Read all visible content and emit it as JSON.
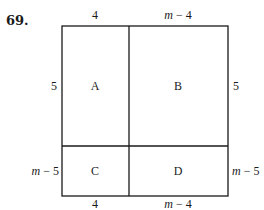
{
  "problem_number": "69.",
  "diagram": {
    "type": "area-model-square",
    "outer_box": {
      "x1": 62,
      "y1": 26,
      "x2": 228,
      "y2": 196
    },
    "dividers": {
      "vertical_x": 129,
      "horizontal_y": 146
    },
    "line_color": "#1a1a1a",
    "regions": [
      {
        "id": "A",
        "label": "A",
        "width": "4",
        "height": "5"
      },
      {
        "id": "B",
        "label": "B",
        "width": "m − 4",
        "height": "5"
      },
      {
        "id": "C",
        "label": "C",
        "width": "4",
        "height": "m − 5"
      },
      {
        "id": "D",
        "label": "D",
        "width": "m − 4",
        "height": "m − 5"
      }
    ],
    "top_labels": {
      "left": "4",
      "right_var": "m",
      "right_rest": " − 4"
    },
    "bottom_labels": {
      "left": "4",
      "right_var": "m",
      "right_rest": " − 4"
    },
    "left_labels": {
      "top": "5",
      "bottom_var": "m",
      "bottom_rest": " − 5"
    },
    "right_labels": {
      "top": "5",
      "bottom_var": "m",
      "bottom_rest": " − 5"
    }
  }
}
